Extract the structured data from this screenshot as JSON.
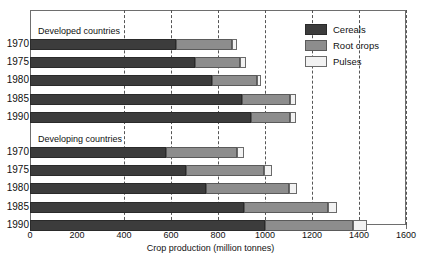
{
  "chart_data": {
    "type": "bar",
    "orientation": "horizontal",
    "stacked": true,
    "title": "",
    "xlabel": "Crop production (million tonnes)",
    "ylabel": "",
    "xlim": [
      0,
      1600
    ],
    "xticks": [
      0,
      200,
      400,
      600,
      800,
      1000,
      1200,
      1400,
      1600
    ],
    "grid": "vertical dashed at 400, 600, 800, 1000, 1200, 1400, 1600",
    "legend": {
      "position": "top-right inside plot",
      "entries": [
        "Cereals",
        "Root crops",
        "Pulses"
      ]
    },
    "series_names": [
      "Cereals",
      "Root crops",
      "Pulses"
    ],
    "groups": [
      {
        "name": "Developed countries",
        "categories": [
          "1970",
          "1975",
          "1980",
          "1985",
          "1990"
        ],
        "series": [
          {
            "name": "Cereals",
            "values": [
              620,
              700,
              775,
              900,
              940
            ]
          },
          {
            "name": "Root crops",
            "values": [
              240,
              195,
              190,
              205,
              165
            ]
          },
          {
            "name": "Pulses",
            "values": [
              20,
              25,
              20,
              25,
              25
            ]
          }
        ],
        "totals": [
          880,
          920,
          985,
          1130,
          1130
        ]
      },
      {
        "name": "Developing countries",
        "categories": [
          "1970",
          "1975",
          "1980",
          "1985",
          "1990"
        ],
        "series": [
          {
            "name": "Cereals",
            "values": [
              580,
              665,
              750,
              910,
              1000
            ]
          },
          {
            "name": "Root crops",
            "values": [
              300,
              330,
              350,
              360,
              375
            ]
          },
          {
            "name": "Pulses",
            "values": [
              30,
              35,
              35,
              35,
              60
            ]
          }
        ],
        "totals": [
          910,
          1030,
          1135,
          1305,
          1435
        ]
      }
    ]
  },
  "colors": {
    "cereals": "#3c3c3c",
    "root_crops": "#8d8d8d",
    "pulses": "#f2f2f2",
    "axis": "#6e6e6e",
    "grid": "#555555",
    "text": "#111111"
  }
}
